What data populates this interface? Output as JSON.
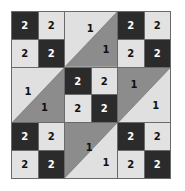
{
  "puzzle": {
    "rows": 6,
    "cols": 6,
    "colors": {
      "dark": "#2b2b2b",
      "light": "#e2e2e2",
      "mid": "#8c8c8c",
      "grid": "#6a6a6a"
    },
    "blocks": [
      {
        "id": "top-left",
        "kind": "checker",
        "cells": [
          [
            "2",
            "2"
          ],
          [
            "2",
            "2"
          ]
        ],
        "shade": [
          [
            "dark",
            "light"
          ],
          [
            "light",
            "dark"
          ]
        ]
      },
      {
        "id": "top-middle",
        "kind": "triangle",
        "orientation": "light-upper-left",
        "light_label": "1",
        "mid_label": "1"
      },
      {
        "id": "top-right",
        "kind": "checker",
        "cells": [
          [
            "2",
            "2"
          ],
          [
            "2",
            "2"
          ]
        ],
        "shade": [
          [
            "dark",
            "light"
          ],
          [
            "light",
            "dark"
          ]
        ]
      },
      {
        "id": "middle-left",
        "kind": "triangle",
        "orientation": "light-upper-left",
        "light_label": "1",
        "mid_label": "1"
      },
      {
        "id": "center",
        "kind": "checker",
        "cells": [
          [
            "2",
            "2"
          ],
          [
            "2",
            "2"
          ]
        ],
        "shade": [
          [
            "dark",
            "light"
          ],
          [
            "light",
            "dark"
          ]
        ]
      },
      {
        "id": "middle-right",
        "kind": "triangle",
        "orientation": "mid-upper-left",
        "light_label": "1",
        "mid_label": "1"
      },
      {
        "id": "bottom-left",
        "kind": "checker",
        "cells": [
          [
            "2",
            "2"
          ],
          [
            "2",
            "2"
          ]
        ],
        "shade": [
          [
            "dark",
            "light"
          ],
          [
            "light",
            "dark"
          ]
        ]
      },
      {
        "id": "bottom-middle",
        "kind": "triangle",
        "orientation": "mid-upper-left",
        "light_label": "1",
        "mid_label": "1"
      },
      {
        "id": "bottom-right",
        "kind": "checker",
        "cells": [
          [
            "2",
            "2"
          ],
          [
            "2",
            "2"
          ]
        ],
        "shade": [
          [
            "dark",
            "light"
          ],
          [
            "light",
            "dark"
          ]
        ]
      }
    ]
  }
}
